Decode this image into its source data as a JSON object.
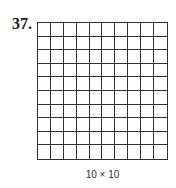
{
  "problem": {
    "number": "37.",
    "grid": {
      "rows": 10,
      "cols": 10,
      "line_color": "#333333"
    },
    "caption": "10 × 10"
  }
}
